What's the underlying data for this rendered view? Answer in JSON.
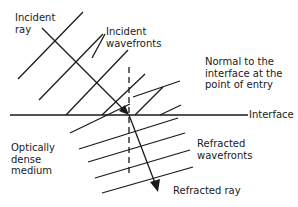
{
  "diagram": {
    "labels": {
      "incident_ray": "Incident\nray",
      "incident_wavefronts": "Incident\nwavefronts",
      "normal": "Normal to the\ninterface at the\npoint of entry",
      "interface": "Interface",
      "medium": "Optically\ndense\nmedium",
      "refracted_wavefronts": "Refracted\nwavefronts",
      "refracted_ray": "Refracted ray"
    },
    "colors": {
      "line": "#1a1a1a",
      "background": "#ffffff"
    }
  }
}
